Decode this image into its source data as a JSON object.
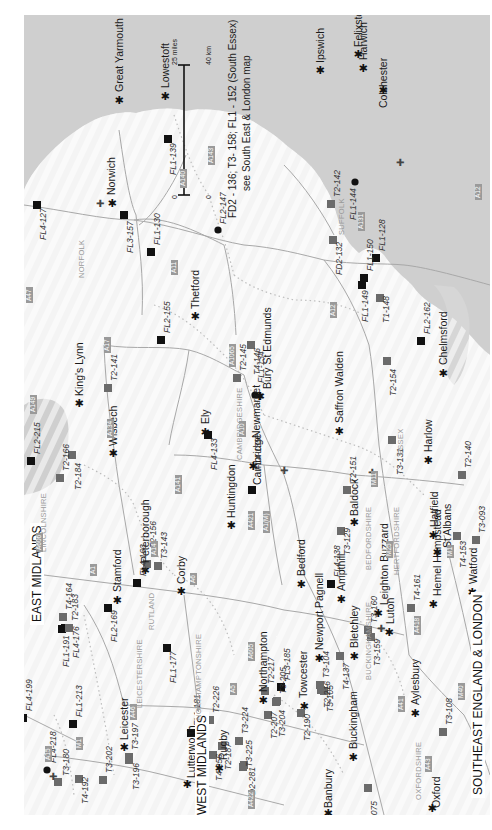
{
  "map": {
    "title_note_line1": "FD2 - 136; T3- 158; FL1 - 152 (South Essex)",
    "title_note_line2": "see South East & London map",
    "scale": {
      "miles_label": "25 miles",
      "km_label": "40 km",
      "zero_miles": "0",
      "zero_km": "0"
    },
    "colors": {
      "sea": "#cfcfcf",
      "land": "#f4f4f4",
      "road": "#9a9a9a",
      "boundary": "#b5b5b5",
      "site_black": "#111111",
      "site_grey": "#6b6b6b"
    },
    "regions": [
      {
        "name": "EAST MIDLANDS"
      },
      {
        "name": "WEST MIDLANDS"
      },
      {
        "name": "SOUTHEAST ENGLAND & LONDON"
      }
    ],
    "counties": [
      "NORFOLK",
      "SUFFOLK",
      "ESSEX",
      "CAMBRIDGESHIRE",
      "HERTFORDSHIRE",
      "BEDFORDSHIRE",
      "BUCKINGHAMSHIRE",
      "OXFORDSHIRE",
      "NORTHAMPTONSHIRE",
      "LEICESTERSHIRE",
      "RUTLAND",
      "LINCOLNSHIRE"
    ],
    "roads": [
      "A12",
      "A143",
      "A140",
      "A11",
      "A47",
      "A149",
      "A17",
      "A134",
      "A1065",
      "A10",
      "A141",
      "A14",
      "A131",
      "A12",
      "M11",
      "A1",
      "A6",
      "A605",
      "A421",
      "A1(M)",
      "M25",
      "M1",
      "A418",
      "A41",
      "M40",
      "A43",
      "A5",
      "A422",
      "A46",
      "A15",
      "A606",
      "M1"
    ],
    "towns": [
      "Great Yarmouth",
      "Lowestoft",
      "Norwich",
      "Thetford",
      "King's Lynn",
      "Wisbech",
      "Ely",
      "Peterborough",
      "Huntingdon",
      "Cambridge",
      "Newmarket",
      "Bury St Edmunds",
      "Saffron Walden",
      "Ipswich",
      "Felixstowe",
      "Harwich",
      "Colchester",
      "Chelmsford",
      "Harlow",
      "Hatfield",
      "St Albans",
      "Baldock",
      "Bedford",
      "Ampthill",
      "Leighton Buzzard",
      "Luton",
      "Bletchley",
      "Newport Pagnell",
      "Hemel Hempstead",
      "Watford",
      "Aylesbury",
      "Oxford",
      "Banbury",
      "Buckingham",
      "Towcester",
      "Northampton",
      "Corby",
      "Stamford",
      "Leicester",
      "Lutterworth",
      "Rugby"
    ],
    "sites": [
      {
        "code": "FL1-139",
        "type": "black"
      },
      {
        "code": "FL2-147",
        "type": "circle"
      },
      {
        "code": "FL4-127",
        "type": "black"
      },
      {
        "code": "FL3-157",
        "type": "black"
      },
      {
        "code": "FL1-130",
        "type": "black"
      },
      {
        "code": "T2-141",
        "type": "grey"
      },
      {
        "code": "FL2-155",
        "type": "black"
      },
      {
        "code": "FL1-134",
        "type": "circle"
      },
      {
        "code": "T2-145",
        "type": "grey"
      },
      {
        "code": "T4-146",
        "type": "grey"
      },
      {
        "code": "T2-142",
        "type": "grey"
      },
      {
        "code": "FL1-144",
        "type": "circle"
      },
      {
        "code": "FD2-132",
        "type": "grey"
      },
      {
        "code": "FL1-150",
        "type": "black"
      },
      {
        "code": "FL1-149",
        "type": "black"
      },
      {
        "code": "FL1-128",
        "type": "black"
      },
      {
        "code": "T1-148",
        "type": "grey"
      },
      {
        "code": "FL2-162",
        "type": "black"
      },
      {
        "code": "T2-154",
        "type": "grey"
      },
      {
        "code": "T3-131",
        "type": "grey"
      },
      {
        "code": "T2-140",
        "type": "grey"
      },
      {
        "code": "T3-093",
        "type": "grey"
      },
      {
        "code": "T4-153",
        "type": "grey"
      },
      {
        "code": "T2-151",
        "type": "grey"
      },
      {
        "code": "T3-129",
        "type": "grey"
      },
      {
        "code": "FL4-138",
        "type": "black"
      },
      {
        "code": "T3-160",
        "type": "grey"
      },
      {
        "code": "T4-161",
        "type": "grey"
      },
      {
        "code": "T3-159",
        "type": "grey"
      },
      {
        "code": "T4-137",
        "type": "grey"
      },
      {
        "code": "T3-104",
        "type": "grey"
      },
      {
        "code": "T3-105",
        "type": "grey"
      },
      {
        "code": "T3-108",
        "type": "grey"
      },
      {
        "code": "T3-075",
        "type": "grey"
      },
      {
        "code": "FL2-215",
        "type": "black"
      },
      {
        "code": "T2-166",
        "type": "grey"
      },
      {
        "code": "T2-184",
        "type": "grey"
      },
      {
        "code": "FL4-133",
        "type": "black"
      },
      {
        "code": "FL4-135",
        "type": "black"
      },
      {
        "code": "FL4-163",
        "type": "black"
      },
      {
        "code": "T3-143",
        "type": "grey"
      },
      {
        "code": "T2-156",
        "type": "grey"
      },
      {
        "code": "FL2-169",
        "type": "black"
      },
      {
        "code": "FL1-191",
        "type": "black"
      },
      {
        "code": "FL4-176",
        "type": "black"
      },
      {
        "code": "T4-164",
        "type": "grey"
      },
      {
        "code": "T2-183",
        "type": "grey"
      },
      {
        "code": "FL1-177",
        "type": "black"
      },
      {
        "code": "FL4-199",
        "type": "black"
      },
      {
        "code": "FL1-213",
        "type": "black"
      },
      {
        "code": "FL4-218",
        "type": "circle"
      },
      {
        "code": "T3-180",
        "type": "grey"
      },
      {
        "code": "T4-192",
        "type": "grey"
      },
      {
        "code": "T3-202",
        "type": "grey"
      },
      {
        "code": "T3-197",
        "type": "grey"
      },
      {
        "code": "T3-196",
        "type": "grey"
      },
      {
        "code": "FL1-181",
        "type": "black"
      },
      {
        "code": "T2-226",
        "type": "grey"
      },
      {
        "code": "T4-256",
        "type": "grey"
      },
      {
        "code": "T2-187",
        "type": "grey"
      },
      {
        "code": "T3-224",
        "type": "grey"
      },
      {
        "code": "T3-225",
        "type": "grey"
      },
      {
        "code": "D2-281",
        "type": "grey"
      },
      {
        "code": "T2-217",
        "type": "grey"
      },
      {
        "code": "T2-207",
        "type": "grey"
      },
      {
        "code": "T3-204",
        "type": "grey"
      },
      {
        "code": "T3-205",
        "type": "grey"
      },
      {
        "code": "FL3-185",
        "type": "black"
      },
      {
        "code": "T2-190",
        "type": "grey"
      },
      {
        "code": "T2-216",
        "type": "grey"
      }
    ]
  }
}
